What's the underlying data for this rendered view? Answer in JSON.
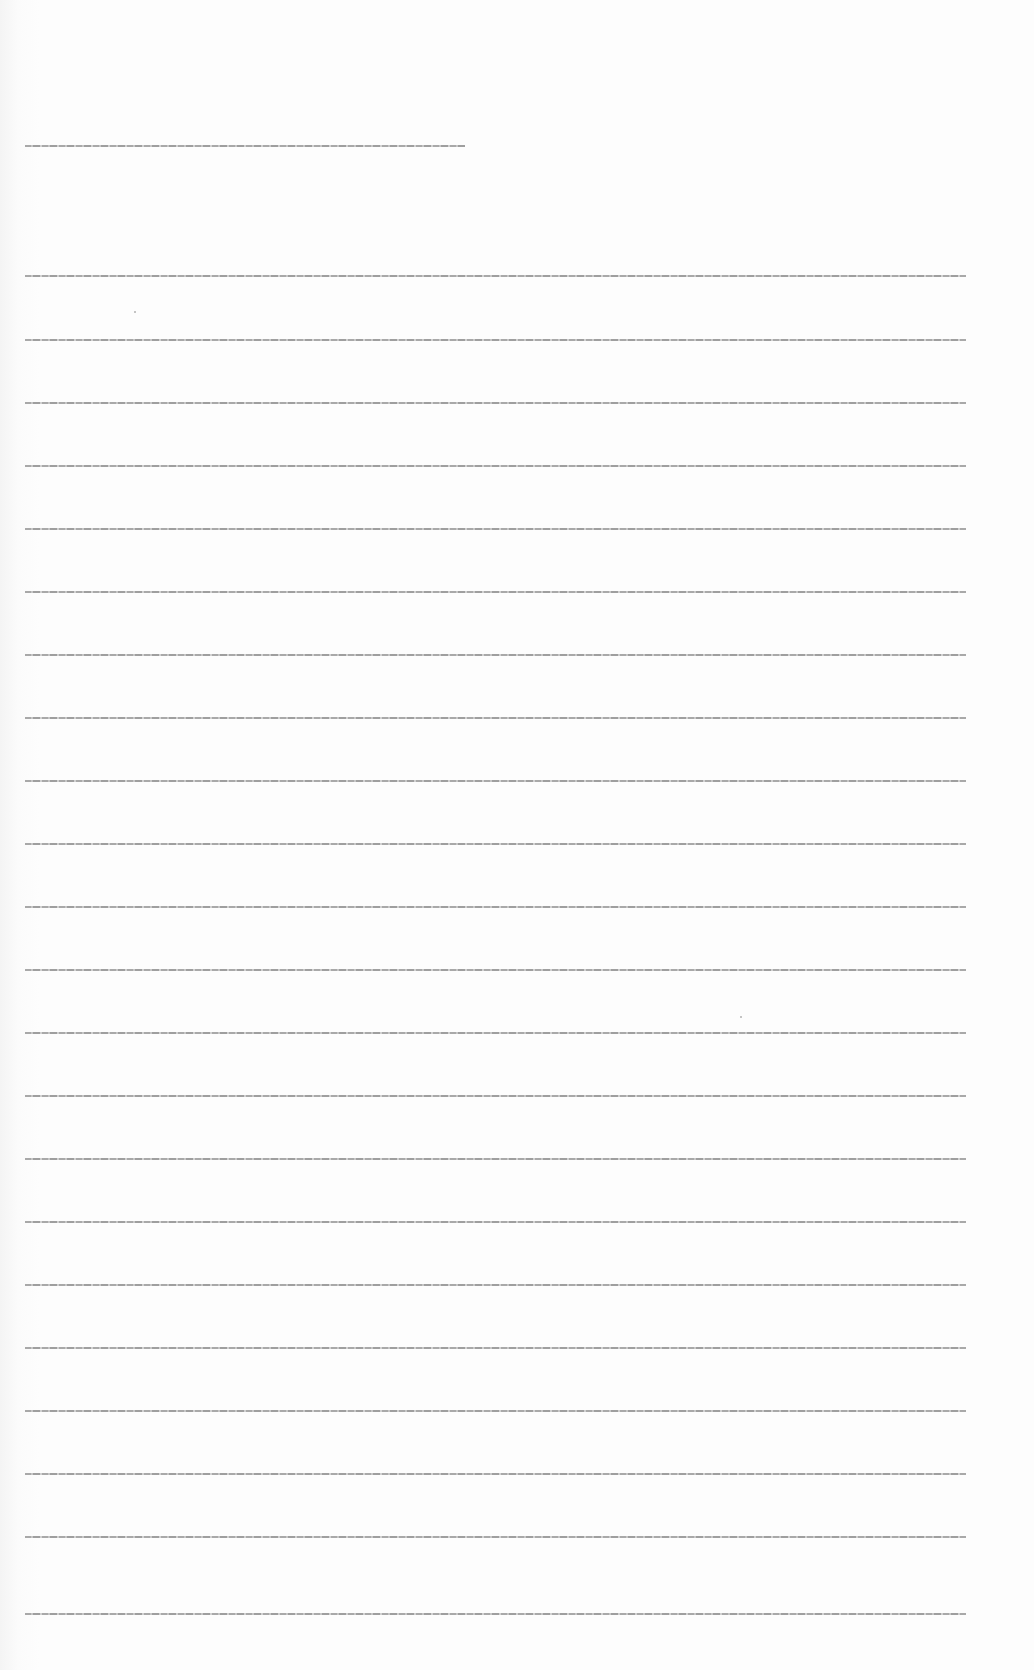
{
  "document": {
    "type": "scanned page",
    "legibility": "text too small to read at this resolution",
    "heading_line": {
      "text": "[illegible]",
      "top": 145,
      "width": 440
    },
    "lines": [
      {
        "text": "[illegible]",
        "top": 275,
        "width": 941
      },
      {
        "text": "[illegible]",
        "top": 339,
        "width": 941
      },
      {
        "text": "[illegible]",
        "top": 402,
        "width": 941
      },
      {
        "text": "[illegible]",
        "top": 465,
        "width": 941
      },
      {
        "text": "[illegible]",
        "top": 528,
        "width": 941
      },
      {
        "text": "[illegible]",
        "top": 591,
        "width": 941
      },
      {
        "text": "[illegible]",
        "top": 654,
        "width": 941
      },
      {
        "text": "[illegible]",
        "top": 717,
        "width": 941
      },
      {
        "text": "[illegible]",
        "top": 780,
        "width": 941
      },
      {
        "text": "[illegible]",
        "top": 843,
        "width": 941
      },
      {
        "text": "[illegible]",
        "top": 906,
        "width": 941
      },
      {
        "text": "[illegible]",
        "top": 969,
        "width": 941
      },
      {
        "text": "[illegible]",
        "top": 1032,
        "width": 941
      },
      {
        "text": "[illegible]",
        "top": 1095,
        "width": 941
      },
      {
        "text": "[illegible]",
        "top": 1158,
        "width": 941
      },
      {
        "text": "[illegible]",
        "top": 1221,
        "width": 941
      },
      {
        "text": "[illegible]",
        "top": 1284,
        "width": 941
      },
      {
        "text": "[illegible]",
        "top": 1347,
        "width": 941
      },
      {
        "text": "[illegible]",
        "top": 1410,
        "width": 941
      },
      {
        "text": "[illegible]",
        "top": 1473,
        "width": 941
      },
      {
        "text": "[illegible]",
        "top": 1536,
        "width": 941
      },
      {
        "text": "[illegible]",
        "top": 1613,
        "width": 941
      }
    ]
  }
}
